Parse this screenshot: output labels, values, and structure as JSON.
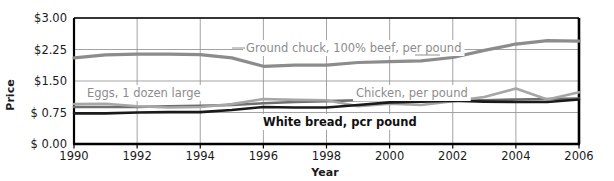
{
  "chart_data": {
    "type": "line",
    "title": "",
    "xlabel": "Year",
    "ylabel": "Price",
    "xlim": [
      1990,
      2006
    ],
    "ylim": [
      0.0,
      3.0
    ],
    "grid": true,
    "legend_position": "inline-annotations",
    "x": [
      1990,
      1991,
      1992,
      1993,
      1994,
      1995,
      1996,
      1997,
      1998,
      1999,
      2000,
      2001,
      2002,
      2003,
      2004,
      2005,
      2006
    ],
    "xtick_labels": [
      "1990",
      "1992",
      "1994",
      "1996",
      "1998",
      "2000",
      "2002",
      "2004",
      "2006"
    ],
    "xticks": [
      1990,
      1992,
      1994,
      1996,
      1998,
      2000,
      2002,
      2004,
      2006
    ],
    "yticks": [
      0.0,
      0.75,
      1.5,
      2.25,
      3.0
    ],
    "ytick_labels": [
      "$ 0.00",
      "$ 0.75",
      "$1.50",
      "$2.25",
      "$3.00"
    ],
    "series": [
      {
        "name": "Ground chuck, 100% beef, per pound",
        "color": "#8c8c8c",
        "width": 3.2,
        "values": [
          2.05,
          2.12,
          2.14,
          2.14,
          2.13,
          2.05,
          1.85,
          1.88,
          1.88,
          1.94,
          1.96,
          1.98,
          2.06,
          2.23,
          2.38,
          2.46,
          2.45
        ]
      },
      {
        "name": "Chicken, per pound",
        "color": "#6e6e6e",
        "width": 2.6,
        "values": [
          0.88,
          0.88,
          0.88,
          0.9,
          0.91,
          0.93,
          0.97,
          1.0,
          1.02,
          1.04,
          1.05,
          1.07,
          1.05,
          1.04,
          1.06,
          1.07,
          1.08
        ]
      },
      {
        "name": "Eggs, 1 dozen large",
        "color": "#a6a6a6",
        "width": 2.6,
        "values": [
          0.95,
          0.96,
          0.9,
          0.87,
          0.88,
          0.95,
          1.07,
          1.05,
          1.04,
          0.9,
          0.96,
          0.93,
          1.02,
          1.12,
          1.32,
          1.06,
          1.23
        ]
      },
      {
        "name": "White bread, per pound",
        "color": "#1a1a1a",
        "width": 2.6,
        "values": [
          0.73,
          0.73,
          0.75,
          0.76,
          0.76,
          0.81,
          0.88,
          0.87,
          0.87,
          0.93,
          0.99,
          1.01,
          1.03,
          1.01,
          1.0,
          1.0,
          1.06
        ]
      }
    ],
    "annotations": [
      {
        "id": "ground-chuck",
        "text": "Ground chuck, 100% beef, per pound",
        "style": "gray",
        "x": 246,
        "y": 52
      },
      {
        "id": "eggs",
        "text": "Eggs, 1 dozen large",
        "style": "gray",
        "x": 87,
        "y": 97
      },
      {
        "id": "chicken",
        "text": "Chicken, per pound",
        "style": "gray",
        "x": 356,
        "y": 97
      },
      {
        "id": "white-bread",
        "text": "White bread, pcr pound",
        "style": "dark",
        "x": 263,
        "y": 126
      }
    ],
    "colors": {
      "ground_chuck": "#8c8c8c",
      "chicken": "#6e6e6e",
      "eggs": "#a6a6a6",
      "white_bread": "#1a1a1a",
      "grid": "#999999",
      "frame": "#000000",
      "background": "#ffffff"
    }
  }
}
